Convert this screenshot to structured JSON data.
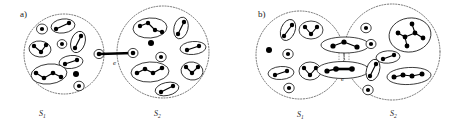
{
  "figure": {
    "type": "diagram",
    "panels": [
      {
        "id": "a",
        "label": "a)",
        "boundaries": [
          {
            "name": "S1",
            "label": "S",
            "subscript": "1",
            "cx": 64,
            "cy": 54,
            "r": 40
          },
          {
            "name": "S2",
            "label": "S",
            "subscript": "2",
            "cx": 162,
            "cy": 52,
            "r": 46
          }
        ],
        "edge": {
          "name": "e",
          "label": "e",
          "x": 120,
          "y": 65
        }
      },
      {
        "id": "b",
        "label": "b)",
        "boundaries": [
          {
            "name": "S1",
            "label": "S",
            "subscript": "1",
            "cx": 300,
            "cy": 54,
            "r": 44
          },
          {
            "name": "S2",
            "label": "S",
            "subscript": "2",
            "cx": 392,
            "cy": 52,
            "r": 48
          }
        ],
        "edge": {
          "name": "e",
          "label": "e",
          "x": 343,
          "y": 80
        }
      }
    ],
    "colors": {
      "ink": "#000000",
      "boundary": "#3a3a3a",
      "paper": "#ffffff",
      "connector": "#555555"
    }
  },
  "labels": {
    "panel_a": "a)",
    "panel_b": "b)",
    "set_one": "S",
    "set_one_sub": "1",
    "set_two": "S",
    "set_two_sub": "2",
    "edge_a": "e",
    "edge_b": "e"
  }
}
